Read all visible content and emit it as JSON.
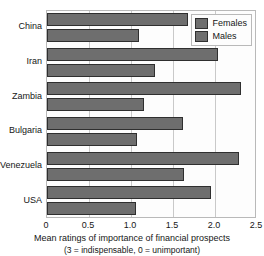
{
  "chart_data": {
    "type": "bar",
    "orientation": "horizontal",
    "title": "",
    "categories": [
      "China",
      "Iran",
      "Zambia",
      "Bulgaria",
      "Venezuela",
      "USA"
    ],
    "series": [
      {
        "name": "Females",
        "values": [
          1.68,
          2.04,
          2.31,
          1.62,
          2.28,
          1.95
        ]
      },
      {
        "name": "Males",
        "values": [
          1.1,
          1.28,
          1.15,
          1.07,
          1.63,
          1.06
        ]
      }
    ],
    "xlabel": "Mean ratings of importance of financial prospects",
    "xsublabel": "(3 = indispensable, 0 = unimportant)",
    "ylabel": "",
    "xlim": [
      0,
      2.5
    ],
    "xticks": [
      0,
      0.5,
      1.0,
      1.5,
      2.0,
      2.5
    ],
    "xtick_labels": [
      "0",
      "0.5",
      "1.0",
      "1.5",
      "2.0",
      "2.5"
    ],
    "grid": true,
    "grid_axis": "x",
    "legend_position": "top-right",
    "legend_entries": [
      "Females",
      "Males"
    ],
    "bar_color": "#6e6e6e",
    "bar_border_color": "#2f2f2f",
    "grid_color": "#c9c9c9",
    "plot_border_color": "#b9b9b9",
    "background_color": "#ffffff"
  }
}
